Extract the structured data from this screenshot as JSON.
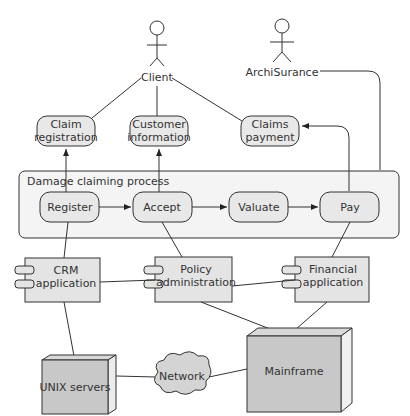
{
  "actors": {
    "client": "Client",
    "archisurance": "ArchiSurance"
  },
  "services": {
    "claim_registration": [
      "Claim",
      "registration"
    ],
    "customer_information": [
      "Customer",
      "information"
    ],
    "claims_payment": [
      "Claims",
      "payment"
    ]
  },
  "process": {
    "title": "Damage claiming process",
    "steps": [
      "Register",
      "Accept",
      "Valuate",
      "Pay"
    ]
  },
  "applications": {
    "crm": [
      "CRM",
      "application"
    ],
    "policy": [
      "Policy",
      "administration"
    ],
    "financial": [
      "Financial",
      "application"
    ]
  },
  "infrastructure": {
    "unix": "UNIX servers",
    "network": "Network",
    "mainframe": "Mainframe"
  },
  "colors": {
    "stroke": "#333333",
    "service_fill": "#e8e8e8",
    "process_fill": "#f4f4f4",
    "app_fill": "#e4e4e4",
    "node_fill": "#c8c8c8"
  }
}
